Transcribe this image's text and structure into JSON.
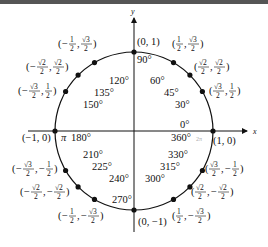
{
  "diagram": {
    "axes": {
      "x_label": "x",
      "y_label": "y"
    },
    "center_px": [
      134,
      131
    ],
    "radius_px": 79,
    "points": [
      {
        "deg": "0°",
        "alt": "360°",
        "rad": "2π",
        "coord": "(1, 0)"
      },
      {
        "deg": "30°",
        "coord": "(√3/2, 1/2)",
        "x_num": "√3",
        "x_den": "2",
        "y_num": "1",
        "y_den": "2",
        "x_sign": "",
        "y_sign": ""
      },
      {
        "deg": "45°",
        "coord": "(√2/2, √2/2)",
        "x_num": "√2",
        "x_den": "2",
        "y_num": "√2",
        "y_den": "2",
        "x_sign": "",
        "y_sign": ""
      },
      {
        "deg": "60°",
        "coord": "(1/2, √3/2)",
        "x_num": "1",
        "x_den": "2",
        "y_num": "√3",
        "y_den": "2",
        "x_sign": "",
        "y_sign": ""
      },
      {
        "deg": "90°",
        "coord": "(0, 1)"
      },
      {
        "deg": "120°",
        "coord": "(−1/2, √3/2)",
        "x_num": "1",
        "x_den": "2",
        "y_num": "√3",
        "y_den": "2",
        "x_sign": "−",
        "y_sign": ""
      },
      {
        "deg": "135°",
        "coord": "(−√2/2, √2/2)",
        "x_num": "√2",
        "x_den": "2",
        "y_num": "√2",
        "y_den": "2",
        "x_sign": "−",
        "y_sign": ""
      },
      {
        "deg": "150°",
        "coord": "(−√3/2, 1/2)",
        "x_num": "√3",
        "x_den": "2",
        "y_num": "1",
        "y_den": "2",
        "x_sign": "−",
        "y_sign": ""
      },
      {
        "deg": "180°",
        "rad": "π",
        "coord": "(−1, 0)"
      },
      {
        "deg": "210°",
        "coord": "(−√3/2, −1/2)",
        "x_num": "√3",
        "x_den": "2",
        "y_num": "1",
        "y_den": "2",
        "x_sign": "−",
        "y_sign": "−"
      },
      {
        "deg": "225°",
        "coord": "(−√2/2, −√2/2)",
        "x_num": "√2",
        "x_den": "2",
        "y_num": "√2",
        "y_den": "2",
        "x_sign": "−",
        "y_sign": "−"
      },
      {
        "deg": "240°",
        "coord": "(−1/2, −√3/2)",
        "x_num": "1",
        "x_den": "2",
        "y_num": "√3",
        "y_den": "2",
        "x_sign": "−",
        "y_sign": "−"
      },
      {
        "deg": "270°",
        "coord": "(0, −1)"
      },
      {
        "deg": "300°",
        "coord": "(1/2, −√3/2)",
        "x_num": "1",
        "x_den": "2",
        "y_num": "√3",
        "y_den": "2",
        "x_sign": "",
        "y_sign": "−"
      },
      {
        "deg": "315°",
        "coord": "(√2/2, −√2/2)",
        "x_num": "√2",
        "x_den": "2",
        "y_num": "√2",
        "y_den": "2",
        "x_sign": "",
        "y_sign": "−"
      },
      {
        "deg": "330°",
        "coord": "(√3/2, −1/2)",
        "x_num": "√3",
        "x_den": "2",
        "y_num": "1",
        "y_den": "2",
        "x_sign": "",
        "y_sign": "−"
      }
    ]
  }
}
